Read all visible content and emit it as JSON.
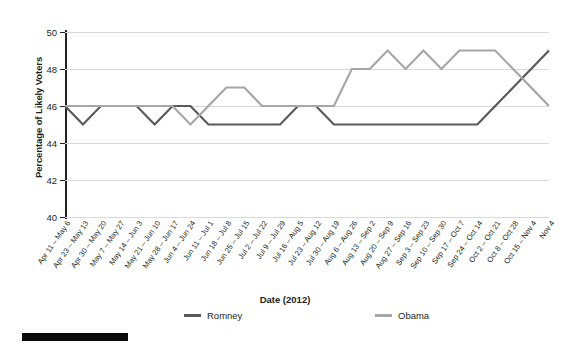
{
  "chart_data": {
    "type": "line",
    "title": "",
    "xlabel": "Date (2012)",
    "ylabel": "Percentage of Likely Voters",
    "ylim": [
      40,
      50
    ],
    "yticks": [
      40,
      42,
      44,
      46,
      48,
      50
    ],
    "grid": true,
    "legend_position": "bottom",
    "categories": [
      "Apr 11 – May 6",
      "Apr 23 – May 13",
      "Apr 30 – May 20",
      "May 7 – May 27",
      "May 14 – Jun 3",
      "May 21 – Jun 10",
      "May 28 – Jun 17",
      "Jun 4 – Jun 24",
      "Jun 11 – Jul 1",
      "Jun 18 – Jul 8",
      "Jun 25 – Jul 15",
      "Jul 2 – Jul 22",
      "Jul 9 – Jul 29",
      "Jul 16 – Aug 5",
      "Jul 23 – Aug 12",
      "Jul 30 – Aug 19",
      "Aug 6 – Aug 26",
      "Aug 13 – Sep 2",
      "Aug 20 – Sep 9",
      "Aug 27 – Sep 16",
      "Sep 3 – Sep 23",
      "Sep 10 – Sep 30",
      "Sep 17 – Oct 7",
      "Sep 24 – Oct 14",
      "Oct 2 – Oct 21",
      "Oct 8 – Oct 28",
      "Oct 15 – Nov 4",
      "Nov 4"
    ],
    "series": [
      {
        "name": "Romney",
        "color": "#595959",
        "values": [
          46,
          45,
          46,
          46,
          46,
          45,
          46,
          46,
          45,
          45,
          45,
          45,
          45,
          46,
          46,
          45,
          45,
          45,
          45,
          45,
          45,
          45,
          45,
          45,
          46,
          47,
          48,
          49
        ]
      },
      {
        "name": "Obama",
        "color": "#a6a6a6",
        "values": [
          46,
          46,
          46,
          46,
          46,
          46,
          46,
          45,
          46,
          47,
          47,
          46,
          46,
          46,
          46,
          46,
          48,
          48,
          49,
          48,
          49,
          48,
          49,
          49,
          49,
          48,
          47,
          46
        ]
      }
    ]
  },
  "legend": {
    "items": [
      {
        "label": "Romney",
        "color": "#595959"
      },
      {
        "label": "Obama",
        "color": "#a6a6a6"
      }
    ]
  },
  "axes": {
    "y_title": "Percentage of Likely Voters",
    "x_title": "Date (2012)"
  }
}
